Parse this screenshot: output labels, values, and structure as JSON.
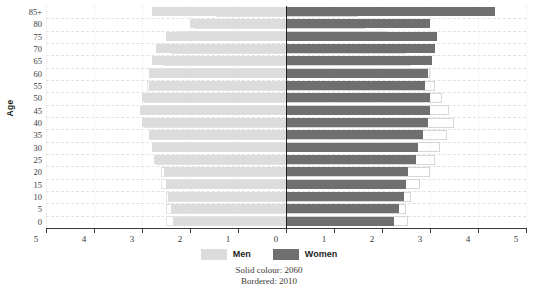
{
  "chart_data": {
    "type": "bar",
    "subtype": "population-pyramid",
    "title": "",
    "xlabel": "",
    "ylabel": "Age",
    "xlim": [
      -5,
      5
    ],
    "xticks": [
      "5",
      "4",
      "3",
      "2",
      "1",
      "0",
      "1",
      "2",
      "3",
      "4",
      "5"
    ],
    "grid": true,
    "legend_position": "bottom",
    "categories": [
      "85+",
      "80",
      "75",
      "70",
      "65",
      "60",
      "55",
      "50",
      "45",
      "40",
      "35",
      "30",
      "25",
      "20",
      "15",
      "10",
      "5",
      "0"
    ],
    "series": [
      {
        "name": "Men",
        "year": "2060",
        "style": "solid",
        "color": "#dcdcdc",
        "side": "left",
        "values": [
          2.8,
          2.0,
          2.5,
          2.7,
          2.8,
          2.85,
          2.85,
          3.0,
          3.05,
          3.0,
          2.85,
          2.8,
          2.75,
          2.55,
          2.5,
          2.45,
          2.4,
          2.35
        ]
      },
      {
        "name": "Men",
        "year": "2010",
        "style": "bordered",
        "color": "#e2e2e2",
        "side": "left",
        "values": [
          1.45,
          1.9,
          2.2,
          2.4,
          2.55,
          2.85,
          2.9,
          2.95,
          2.95,
          2.95,
          2.85,
          2.75,
          2.7,
          2.6,
          2.6,
          2.5,
          2.5,
          2.5
        ]
      },
      {
        "name": "Women",
        "year": "2060",
        "style": "solid",
        "color": "#6f6f6f",
        "side": "right",
        "values": [
          4.35,
          3.0,
          3.15,
          3.1,
          3.05,
          2.95,
          2.9,
          3.0,
          3.0,
          2.95,
          2.85,
          2.75,
          2.7,
          2.55,
          2.5,
          2.45,
          2.35,
          2.25
        ]
      },
      {
        "name": "Women",
        "year": "2010",
        "style": "bordered",
        "color": "#d7d7d7",
        "side": "right",
        "values": [
          1.5,
          1.65,
          2.1,
          2.5,
          2.6,
          3.0,
          3.1,
          3.25,
          3.4,
          3.5,
          3.35,
          3.2,
          3.1,
          3.0,
          2.8,
          2.6,
          2.5,
          2.55
        ]
      }
    ]
  },
  "axis": {
    "y_title": "Age",
    "y_labels": [
      "85+",
      "80",
      "75",
      "70",
      "65",
      "60",
      "55",
      "50",
      "45",
      "40",
      "35",
      "30",
      "25",
      "20",
      "15",
      "10",
      "5",
      "0"
    ],
    "x_labels": [
      "5",
      "4",
      "3",
      "2",
      "1",
      "0",
      "1",
      "2",
      "3",
      "4",
      "5"
    ]
  },
  "legend": {
    "items": [
      {
        "label": "Men",
        "color": "#dcdcdc"
      },
      {
        "label": "Women",
        "color": "#6f6f6f"
      }
    ]
  },
  "caption": {
    "line1": "Solid colour: 2060",
    "line2": "Bordered: 2010"
  },
  "colors": {
    "men_solid": "#dcdcdc",
    "women_solid": "#6f6f6f",
    "men_border": "#e2e2e2",
    "women_border": "#d7d7d7",
    "axis": "#3b3a3a",
    "grid": "#e3e1e2",
    "text": "#231f20",
    "background": "#ffffff"
  }
}
